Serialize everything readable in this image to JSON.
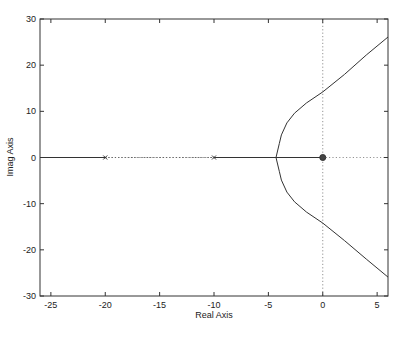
{
  "chart_data": {
    "type": "line",
    "title": "",
    "xlabel": "Real Axis",
    "ylabel": "Imag Axis",
    "xlim": [
      -26,
      6
    ],
    "ylim": [
      -30,
      30
    ],
    "grid": false,
    "xticks": [
      -25,
      -20,
      -15,
      -10,
      -5,
      0,
      5
    ],
    "xtick_labels": [
      "-25",
      "-20",
      "-15",
      "-10",
      "-5",
      "0",
      "5"
    ],
    "yticks": [
      30,
      20,
      10,
      0,
      -10,
      -20,
      -30
    ],
    "ytick_labels": [
      "30",
      "20",
      "10",
      "0",
      "-10",
      "-20",
      "-30"
    ],
    "reference_lines": [
      {
        "orientation": "vertical",
        "value": 0,
        "style": "dotted"
      },
      {
        "orientation": "horizontal",
        "value": 0,
        "style": "dotted"
      }
    ],
    "series": [
      {
        "name": "locus-real-left",
        "style": "solid",
        "points": [
          [
            -26,
            0
          ],
          [
            -20,
            0
          ]
        ]
      },
      {
        "name": "locus-real-gap",
        "style": "dotted",
        "points": [
          [
            -20,
            0
          ],
          [
            -10,
            0
          ]
        ]
      },
      {
        "name": "locus-real-right",
        "style": "solid",
        "points": [
          [
            -10,
            0
          ],
          [
            0,
            0
          ]
        ]
      },
      {
        "name": "locus-branch-upper",
        "style": "solid",
        "points": [
          [
            -4.3,
            0
          ],
          [
            -4.0,
            3
          ],
          [
            -3.8,
            4.9
          ],
          [
            -3.3,
            7.5
          ],
          [
            -2.6,
            9.6
          ],
          [
            -1.5,
            11.8
          ],
          [
            0,
            14.2
          ],
          [
            2,
            18
          ],
          [
            4,
            22.2
          ],
          [
            6,
            26.1
          ]
        ]
      },
      {
        "name": "locus-branch-lower",
        "style": "solid",
        "points": [
          [
            -4.3,
            0
          ],
          [
            -4.0,
            -3
          ],
          [
            -3.8,
            -4.9
          ],
          [
            -3.3,
            -7.5
          ],
          [
            -2.6,
            -9.6
          ],
          [
            -1.5,
            -11.8
          ],
          [
            0,
            -14.2
          ],
          [
            2,
            -18
          ],
          [
            4,
            -22.0
          ],
          [
            6,
            -25.9
          ]
        ]
      }
    ],
    "markers": [
      {
        "type": "pole",
        "glyph": "x",
        "x": -20,
        "y": 0
      },
      {
        "type": "pole",
        "glyph": "x",
        "x": -10,
        "y": 0
      },
      {
        "type": "zero",
        "glyph": "o",
        "x": 0,
        "y": 0
      }
    ]
  }
}
